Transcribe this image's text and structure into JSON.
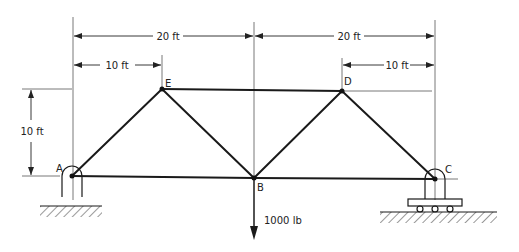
{
  "diagram": {
    "type": "truss",
    "nodes": [
      {
        "id": "A",
        "label": "A"
      },
      {
        "id": "B",
        "label": "B"
      },
      {
        "id": "C",
        "label": "C"
      },
      {
        "id": "D",
        "label": "D"
      },
      {
        "id": "E",
        "label": "E"
      }
    ],
    "members": [
      "AE",
      "AB",
      "EB",
      "ED",
      "BD",
      "DC",
      "BC"
    ],
    "dimensions": {
      "span_left": "20 ft",
      "span_right": "20 ft",
      "offset_left": "10 ft",
      "offset_right": "10 ft",
      "height": "10 ft"
    },
    "load": {
      "node": "B",
      "label": "1000 lb",
      "direction": "down"
    },
    "supports": {
      "A": "pin",
      "C": "roller"
    }
  }
}
